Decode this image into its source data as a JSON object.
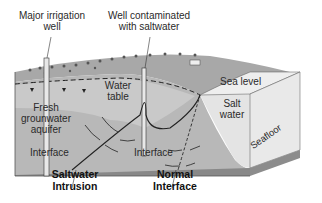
{
  "diagram": {
    "labels": {
      "irrigation_well": [
        "Major irrigation",
        "well"
      ],
      "contaminated_well": [
        "Well contaminated",
        "with saltwater"
      ],
      "sea_level": "Sea level",
      "salt_water": [
        "Salt",
        "water"
      ],
      "water_table": [
        "Water",
        "table"
      ],
      "aquifer": [
        "Fresh",
        "grounwater",
        "aquifer"
      ],
      "interface_left": "Interface",
      "interface_mid": "Interface",
      "seafloor": "Seafloor",
      "saltwater_intrusion": [
        "Saltwater",
        "Intrusion"
      ],
      "normal_interface": [
        "Normal",
        "Interface"
      ]
    },
    "colors": {
      "aquifer": "#b4b4b4",
      "aquifer_light": "#cfcfcf",
      "land_top": "#9a9a9a",
      "salt_water": "#e6e6e6",
      "sea_surface": "#f0f0f0",
      "seafloor": "#8c8c8c",
      "lines": "#222222"
    }
  }
}
